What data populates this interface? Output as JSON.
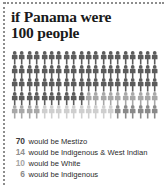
{
  "title": {
    "line1": "if Panama were",
    "line2": "100 people"
  },
  "chart_data": {
    "type": "pictogram",
    "title": "if Panama were 100 people",
    "total": 100,
    "unit_label": "person",
    "columns": 20,
    "rows": 5,
    "categories": [
      "Mestizo",
      "Indigenous & West Indian",
      "White",
      "Indigenous"
    ],
    "values": [
      70,
      14,
      10,
      6
    ],
    "colors": [
      "#5c5c5c",
      "#a8a8a8",
      "#cfcfcf",
      "#8a8a8a"
    ],
    "legend_position": "bottom",
    "legend_format": "{value} would be {category}",
    "series": [
      {
        "name": "Mestizo",
        "value": 70,
        "color": "#5c5c5c"
      },
      {
        "name": "Indigenous & West Indian",
        "value": 14,
        "color": "#a8a8a8"
      },
      {
        "name": "White",
        "value": 10,
        "color": "#cfcfcf"
      },
      {
        "name": "Indigenous",
        "value": 6,
        "color": "#8a8a8a"
      }
    ]
  },
  "legend": [
    {
      "value": "70",
      "text": "would be Mestizo",
      "color": "#3c3c3c"
    },
    {
      "value": "14",
      "text": "would be Indigenous & West Indian",
      "color": "#8f8f8f"
    },
    {
      "value": "10",
      "text": "would be White",
      "color": "#a5a5a5"
    },
    {
      "value": "6",
      "text": "would be Indigenous",
      "color": "#8a8a8a"
    }
  ]
}
